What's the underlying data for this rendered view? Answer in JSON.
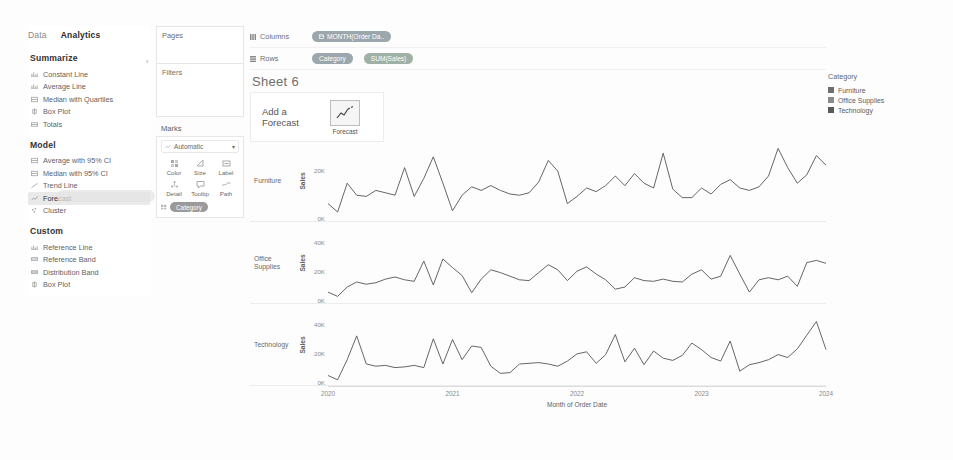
{
  "left_pane": {
    "tabs": [
      {
        "label": "Data",
        "active": false
      },
      {
        "label": "Analytics",
        "active": true
      }
    ],
    "collapse_icon": "chevron-left-icon",
    "sections": [
      {
        "title": "Summarize",
        "items": [
          {
            "label": "Constant Line",
            "icon": "constant-line-icon",
            "selected": false
          },
          {
            "label": "Average Line",
            "icon": "average-line-icon",
            "selected": false
          },
          {
            "label": "Median with Quartiles",
            "icon": "median-quartiles-icon",
            "selected": false
          },
          {
            "label": "Box Plot",
            "icon": "box-plot-icon",
            "selected": false
          },
          {
            "label": "Totals",
            "icon": "totals-icon",
            "selected": false
          }
        ]
      },
      {
        "title": "Model",
        "items": [
          {
            "label": "Average with 95% CI",
            "icon": "average-ci-icon",
            "selected": false
          },
          {
            "label": "Median with 95% CI",
            "icon": "median-ci-icon",
            "selected": false
          },
          {
            "label": "Trend Line",
            "icon": "trend-line-icon",
            "selected": false
          },
          {
            "label": "Forecast",
            "icon": "forecast-icon",
            "selected": true
          },
          {
            "label": "Cluster",
            "icon": "cluster-icon",
            "selected": false
          }
        ]
      },
      {
        "title": "Custom",
        "items": [
          {
            "label": "Reference Line",
            "icon": "reference-line-icon",
            "selected": false
          },
          {
            "label": "Reference Band",
            "icon": "reference-band-icon",
            "selected": false
          },
          {
            "label": "Distribution Band",
            "icon": "distribution-band-icon",
            "selected": false
          },
          {
            "label": "Box Plot",
            "icon": "box-plot-icon",
            "selected": false
          }
        ]
      }
    ]
  },
  "shelves": {
    "pages_label": "Pages",
    "filters_label": "Filters",
    "marks_label": "Marks",
    "mark_type": "Automatic",
    "mark_type_icon": "line-mark-icon",
    "mark_type_caret": "chevron-down-icon",
    "buttons": [
      {
        "label": "Color",
        "icon": "color-icon"
      },
      {
        "label": "Size",
        "icon": "size-icon"
      },
      {
        "label": "Label",
        "icon": "label-icon"
      },
      {
        "label": "Detail",
        "icon": "detail-icon"
      },
      {
        "label": "Tooltip",
        "icon": "tooltip-icon"
      },
      {
        "label": "Path",
        "icon": "path-icon"
      }
    ],
    "marks_pill": {
      "label": "Category",
      "icon": "color-legend-icon"
    }
  },
  "top_shelves": {
    "columns_label": "Columns",
    "columns_icon": "columns-icon",
    "rows_label": "Rows",
    "rows_icon": "rows-icon",
    "columns_pills": [
      {
        "label": "MONTH(Order Da..",
        "icon": "calendar-icon",
        "color": "#9ba7ad"
      }
    ],
    "rows_pills": [
      {
        "label": "Category",
        "color": "#9ba7ad"
      },
      {
        "label": "SUM(Sales)",
        "color": "#9fb0a4"
      }
    ]
  },
  "sheet": {
    "title": "Sheet 6",
    "drop_target": {
      "line1": "Add a",
      "line2": "Forecast",
      "chip_label": "Forecast",
      "chip_icon": "forecast-chart-icon"
    }
  },
  "legend": {
    "title": "Category",
    "items": [
      {
        "label": "Furniture",
        "color": "#6e6e6e"
      },
      {
        "label": "Office Supplies",
        "color": "#8a8a8a"
      },
      {
        "label": "Technology",
        "color": "#5a5a5a"
      }
    ]
  },
  "chart_data": {
    "type": "line",
    "title": "Sheet 6",
    "xlabel": "Month of Order Date",
    "ylabel": "Sales",
    "grid": false,
    "legend_position": "right",
    "x_tick_labels": [
      "2020",
      "2021",
      "2022",
      "2023",
      "2024"
    ],
    "x_tick_positions": [
      0,
      12,
      24,
      36,
      48
    ],
    "x_range": [
      0,
      48
    ],
    "line_color": "#555555",
    "panels": [
      {
        "name": "Furniture",
        "ylabel": "Sales",
        "y_ticks": [
          0,
          20000
        ],
        "y_tick_labels": [
          "0K",
          "20K"
        ],
        "ylim": [
          0,
          30000
        ],
        "values": [
          6000,
          2500,
          14500,
          9500,
          9000,
          11500,
          10500,
          9500,
          21000,
          9000,
          16500,
          25500,
          14500,
          3000,
          9500,
          13000,
          11500,
          13500,
          11500,
          10000,
          9500,
          10500,
          15000,
          24000,
          19500,
          6000,
          9000,
          12500,
          11000,
          13500,
          17500,
          13500,
          18500,
          14500,
          12500,
          27000,
          12000,
          8500,
          8500,
          12500,
          10000,
          14000,
          16000,
          12500,
          11500,
          13000,
          17500,
          29000,
          21000,
          14500,
          18000,
          26000,
          22000
        ]
      },
      {
        "name": "Office Supplies",
        "ylabel": "Sales",
        "y_ticks": [
          0,
          20000,
          40000
        ],
        "y_tick_labels": [
          "0K",
          "20K",
          "40K"
        ],
        "ylim": [
          0,
          50000
        ],
        "values": [
          5500,
          2500,
          9000,
          12500,
          11000,
          12000,
          14500,
          16000,
          14000,
          13000,
          27000,
          10500,
          28500,
          22500,
          17000,
          5000,
          14500,
          21000,
          19000,
          16500,
          14000,
          13500,
          19000,
          24500,
          21000,
          13500,
          20000,
          23000,
          18000,
          14000,
          7500,
          9000,
          15500,
          13500,
          13000,
          14500,
          13000,
          12500,
          18000,
          21000,
          14500,
          16500,
          31000,
          18000,
          5500,
          14000,
          15500,
          14000,
          16500,
          9500,
          26000,
          27500,
          25500
        ]
      },
      {
        "name": "Technology",
        "ylabel": "Sales",
        "y_ticks": [
          0,
          20000,
          40000
        ],
        "y_tick_labels": [
          "0K",
          "20K",
          "40K"
        ],
        "ylim": [
          0,
          50000
        ],
        "values": [
          4500,
          1500,
          15500,
          32000,
          12500,
          11000,
          11500,
          10000,
          10500,
          11500,
          10000,
          30000,
          12500,
          29500,
          15500,
          25000,
          24000,
          11000,
          6000,
          6500,
          12500,
          13000,
          13500,
          12500,
          11000,
          14500,
          19500,
          21000,
          13000,
          19000,
          33000,
          14000,
          23500,
          12000,
          21500,
          16500,
          15000,
          18500,
          27000,
          22500,
          17000,
          14500,
          28500,
          7500,
          12000,
          13500,
          15500,
          19000,
          17000,
          23000,
          32500,
          42000,
          22500
        ]
      }
    ]
  }
}
